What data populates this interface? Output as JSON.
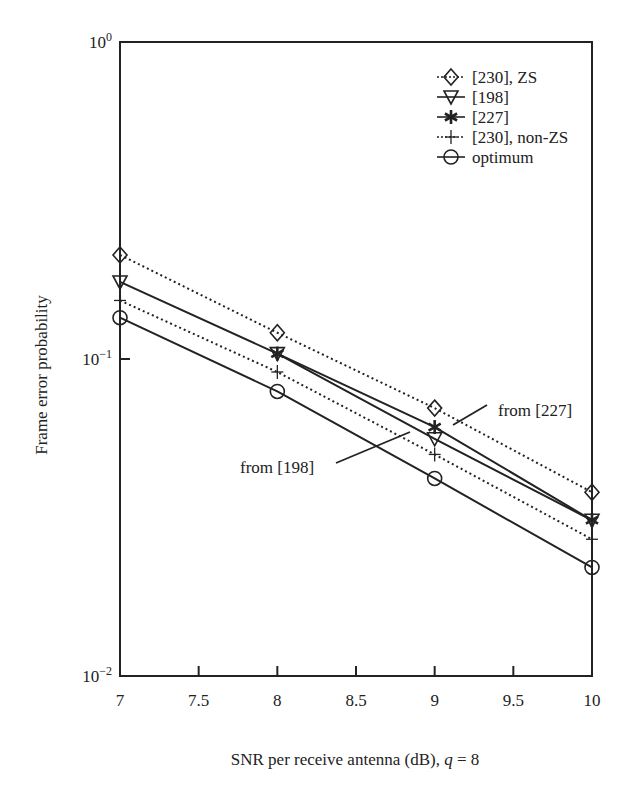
{
  "chart_data": {
    "type": "line",
    "title": "",
    "xlabel": "SNR per receive antenna (dB), q = 8",
    "xlabel_parts": {
      "prefix": "SNR per receive antenna (dB), ",
      "var": "q",
      "suffix": " = 8"
    },
    "ylabel": "Frame error probability",
    "xscale": "linear",
    "yscale": "log",
    "xlim": [
      7,
      10
    ],
    "ylim": [
      0.01,
      1
    ],
    "xticks": [
      "7",
      "7.5",
      "8",
      "8.5",
      "9",
      "9.5",
      "10"
    ],
    "xtick_values": [
      7,
      7.5,
      8,
      8.5,
      9,
      9.5,
      10
    ],
    "yticks": [
      {
        "value": 1,
        "base": "10",
        "exp": "0"
      },
      {
        "value": 0.1,
        "base": "10",
        "exp": "−1"
      },
      {
        "value": 0.01,
        "base": "10",
        "exp": "−2"
      }
    ],
    "grid": false,
    "legend_position": "upper right",
    "series": [
      {
        "name": "[230], ZS",
        "marker": "diamond",
        "linestyle": "dotted",
        "x": [
          7,
          8,
          9,
          10
        ],
        "values": [
          0.213,
          0.121,
          0.07,
          0.038
        ]
      },
      {
        "name": "[198]",
        "marker": "triangle-down",
        "linestyle": "solid",
        "x": [
          7,
          8,
          9,
          10
        ],
        "values": [
          0.175,
          0.104,
          0.056,
          0.031
        ]
      },
      {
        "name": "[227]",
        "marker": "star",
        "linestyle": "solid",
        "x": [
          8,
          9,
          10
        ],
        "values": [
          0.104,
          0.061,
          0.031
        ]
      },
      {
        "name": "[230], non-ZS",
        "marker": "plus",
        "linestyle": "dotted",
        "x": [
          7,
          8,
          9,
          10
        ],
        "values": [
          0.153,
          0.091,
          0.05,
          0.027
        ]
      },
      {
        "name": "optimum",
        "marker": "circle",
        "linestyle": "solid",
        "x": [
          7,
          8,
          9,
          10
        ],
        "values": [
          0.135,
          0.079,
          0.042,
          0.022
        ]
      }
    ],
    "annotations": [
      {
        "text": "from [227]",
        "text_px": [
          498,
          416
        ],
        "line_px": [
          [
            453,
            425
          ],
          [
            487,
            405
          ]
        ]
      },
      {
        "text": "from [198]",
        "text_px": [
          240,
          473
        ],
        "line_px": [
          [
            336,
            463
          ],
          [
            410,
            432
          ]
        ]
      }
    ]
  },
  "colors": {
    "line": "#222222",
    "axis": "#222222",
    "background": "#ffffff"
  }
}
